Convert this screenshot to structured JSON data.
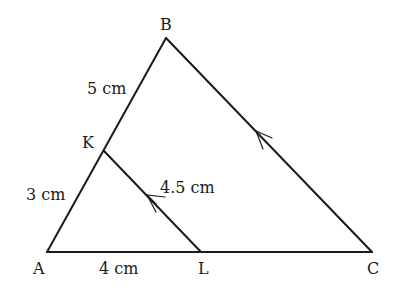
{
  "diagram": {
    "type": "triangle-with-parallel-segment",
    "vertices": {
      "A": {
        "label": "A",
        "x": 47,
        "y": 252
      },
      "B": {
        "label": "B",
        "x": 166,
        "y": 38
      },
      "C": {
        "label": "C",
        "x": 372,
        "y": 252
      },
      "K": {
        "label": "K",
        "x": 104,
        "y": 151
      },
      "L": {
        "label": "L",
        "x": 201,
        "y": 252
      }
    },
    "segments": [
      {
        "from": "A",
        "to": "B"
      },
      {
        "from": "B",
        "to": "C",
        "parallel_mark": true
      },
      {
        "from": "A",
        "to": "C"
      },
      {
        "from": "K",
        "to": "L",
        "parallel_mark": true
      }
    ],
    "measurements": {
      "KB": "5 cm",
      "AK": "3 cm",
      "KL": "4.5 cm",
      "AL": "4 cm"
    },
    "stroke_color": "#1a1a1a",
    "background": "#ffffff"
  }
}
